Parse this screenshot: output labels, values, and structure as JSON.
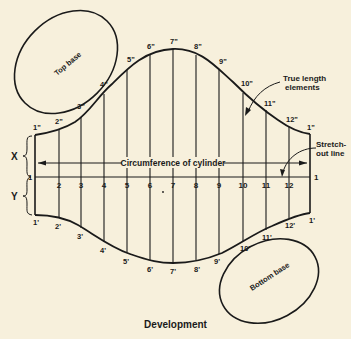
{
  "diagram": {
    "title": "Development",
    "colors": {
      "background": "#f7f0dc",
      "ink": "#1a1a1a"
    },
    "ellipses": {
      "top_base": {
        "label": "Top base"
      },
      "bottom_base": {
        "label": "Bottom base"
      }
    },
    "annotations": {
      "circumference": "Circumference of cylinder",
      "true_length_1": "True length",
      "true_length_2": "elements",
      "stretch_out_1": "Stretch-",
      "stretch_out_2": "out line",
      "x_label": "X",
      "y_label": "Y",
      "stretch_left_num": "1",
      "stretch_right_num": "1"
    },
    "element_numbers": [
      "2",
      "3",
      "4",
      "5",
      "6",
      "7",
      "8",
      "9",
      "10",
      "11",
      "12"
    ],
    "top_points": [
      "1\"",
      "2\"",
      "3\"",
      "4\"",
      "5\"",
      "6\"",
      "7\"",
      "8\"",
      "9\"",
      "10\"",
      "11\"",
      "12\"",
      "1\""
    ],
    "bottom_points": [
      "1'",
      "2'",
      "3'",
      "4'",
      "5'",
      "6'",
      "7'",
      "8'",
      "9'",
      "10'",
      "11'",
      "12'",
      "1'"
    ]
  }
}
